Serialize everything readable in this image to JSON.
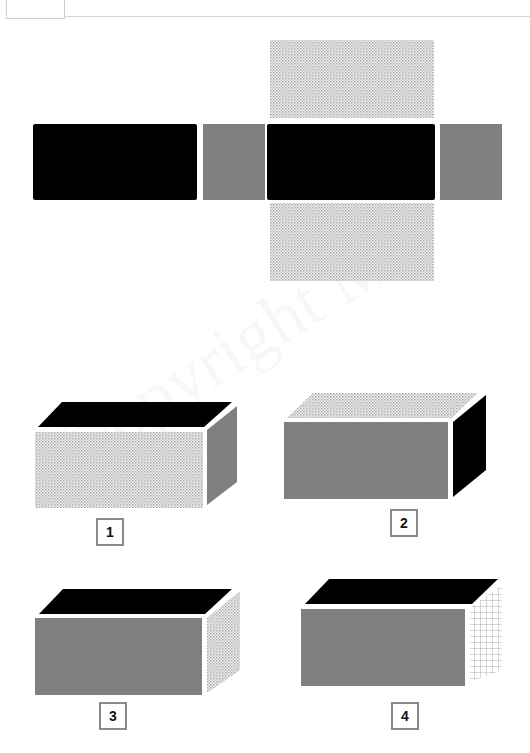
{
  "header": {
    "question_box": ""
  },
  "watermark": "©opyright Me",
  "net": {
    "faces": [
      {
        "id": "left-long",
        "fill": "black"
      },
      {
        "id": "left-end",
        "fill": "gray"
      },
      {
        "id": "center",
        "fill": "black"
      },
      {
        "id": "right-end",
        "fill": "gray"
      },
      {
        "id": "top-flap",
        "fill": "dotted"
      },
      {
        "id": "bottom-flap",
        "fill": "dotted"
      }
    ]
  },
  "options": [
    {
      "label": "1",
      "front": "dotted",
      "top": "black",
      "side": "gray"
    },
    {
      "label": "2",
      "front": "gray",
      "top": "dotted",
      "side": "black"
    },
    {
      "label": "3",
      "front": "gray",
      "top": "black",
      "side": "dotted"
    },
    {
      "label": "4",
      "front": "gray",
      "top": "black",
      "side": "grid"
    }
  ],
  "colors": {
    "black": "#000000",
    "gray": "#808080",
    "dotted": "#b8b8b8",
    "grid": "#9a9a9a",
    "label_border": "#8a8a8a"
  }
}
